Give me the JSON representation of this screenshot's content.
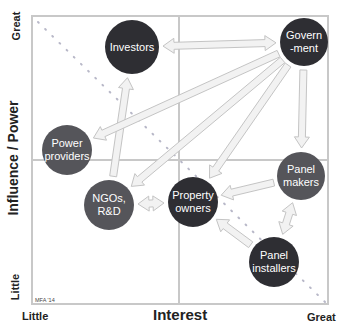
{
  "diagram": {
    "y_axis": {
      "label": "Influence / Power",
      "low": "Little",
      "high": "Great"
    },
    "x_axis": {
      "label": "Interest",
      "low": "Little",
      "high": "Great"
    },
    "credit": "MFA '14",
    "colors": {
      "dark_node": "#2e2e33",
      "mid_node": "#55555a",
      "frame": "#c8c8c8",
      "arrow_fill": "#f2f2f2",
      "arrow_stroke": "#c4c4c4",
      "diagonal_dots": "#b8b8c8"
    },
    "nodes": [
      {
        "id": "investors",
        "label": "Investors",
        "x": 132,
        "y": 47,
        "r": 27,
        "shade": "dark"
      },
      {
        "id": "government",
        "label": "Govern\n-ment",
        "x": 304,
        "y": 42,
        "r": 24,
        "shade": "dark"
      },
      {
        "id": "power-providers",
        "label": "Power\nproviders",
        "x": 67,
        "y": 150,
        "r": 25,
        "shade": "mid"
      },
      {
        "id": "ngos-rd",
        "label": "NGOs,\nR&D",
        "x": 109,
        "y": 205,
        "r": 25,
        "shade": "mid"
      },
      {
        "id": "property-owners",
        "label": "Property\nowners",
        "x": 193,
        "y": 202,
        "r": 25,
        "shade": "dark"
      },
      {
        "id": "panel-makers",
        "label": "Panel\nmakers",
        "x": 301,
        "y": 176,
        "r": 24,
        "shade": "mid"
      },
      {
        "id": "panel-installers",
        "label": "Panel\ninstallers",
        "x": 274,
        "y": 262,
        "r": 25,
        "shade": "dark"
      }
    ],
    "arrows": [
      {
        "from": "investors",
        "to": "government",
        "bidirectional": true
      },
      {
        "from": "ngos-rd",
        "to": "investors",
        "bidirectional": false
      },
      {
        "from": "government",
        "to": "power-providers",
        "bidirectional": false
      },
      {
        "from": "government",
        "to": "ngos-rd",
        "bidirectional": false
      },
      {
        "from": "government",
        "to": "property-owners",
        "bidirectional": false
      },
      {
        "from": "government",
        "to": "panel-makers",
        "bidirectional": false
      },
      {
        "from": "ngos-rd",
        "to": "property-owners",
        "bidirectional": true
      },
      {
        "from": "panel-makers",
        "to": "property-owners",
        "bidirectional": false
      },
      {
        "from": "panel-installers",
        "to": "property-owners",
        "bidirectional": false
      },
      {
        "from": "panel-installers",
        "to": "panel-makers",
        "bidirectional": true
      }
    ]
  }
}
